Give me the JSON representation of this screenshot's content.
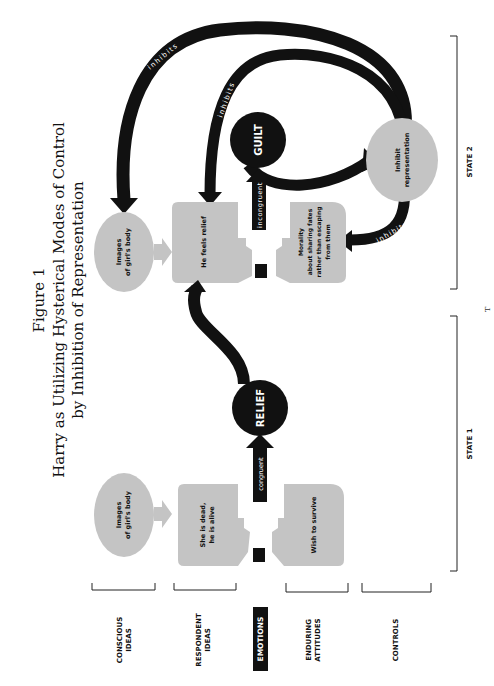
{
  "figure": {
    "label": "Figure 1",
    "title_line1": "Harry as Utilizing Hysterical Modes of Control",
    "title_line2": "by Inhibition of Representation"
  },
  "rows": {
    "conscious_ideas": [
      "CONSCIOUS",
      "IDEAS"
    ],
    "respondent_ideas": [
      "RESPONDENT",
      "IDEAS"
    ],
    "emotions": "EMOTIONS",
    "enduring_attitudes": [
      "ENDURING",
      "ATTITUDES"
    ],
    "controls": "CONTROLS"
  },
  "states": {
    "state1": {
      "label": "STATE 1",
      "conscious": [
        "Images",
        "of girl's body"
      ],
      "respondent": [
        "She is dead,",
        "he is alive"
      ],
      "emotion_link": "congruent",
      "emotion": "RELIEF",
      "enduring": "Wish to survive"
    },
    "state2": {
      "label": "STATE 2",
      "conscious": [
        "Images",
        "of girl's body"
      ],
      "respondent": "He feels relief",
      "emotion_link": "incongruent",
      "emotion": "GUILT",
      "enduring": [
        "Morality",
        "about sharing fates",
        "rather than escaping",
        "from them"
      ],
      "control": [
        "Inhibit",
        "representation"
      ],
      "arrow_labels": [
        "inhibits",
        "inhibits",
        "inhibits"
      ]
    }
  },
  "page_mark": "T",
  "colors": {
    "ink": "#111111",
    "fill_gray": "#c4c4c4",
    "paper": "#ffffff"
  }
}
